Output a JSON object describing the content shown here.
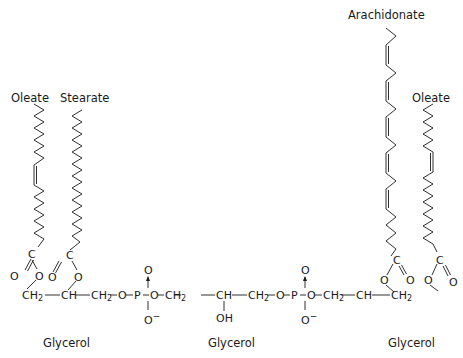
{
  "diagram": {
    "type": "chemical-structure",
    "fatty_acid_labels": [
      {
        "id": "left-1",
        "text": "Oleate"
      },
      {
        "id": "left-2",
        "text": "Stearate"
      },
      {
        "id": "right-1",
        "text": "Arachidonate"
      },
      {
        "id": "right-2",
        "text": "Oleate"
      }
    ],
    "backbone_labels": [
      {
        "id": "glycerol-left",
        "text": "Glycerol"
      },
      {
        "id": "glycerol-middle",
        "text": "Glycerol"
      },
      {
        "id": "glycerol-right",
        "text": "Glycerol"
      }
    ],
    "atoms": {
      "carbonyl_c": "C",
      "carbonyl_o": "O",
      "ester_o": "O",
      "ch2": "CH",
      "ch2_sub": "2",
      "ch": "CH",
      "bridge_o": "O",
      "phosphorus": "P",
      "phosphate_o_top": "O",
      "phosphate_o_bottom": "O",
      "minus": "−",
      "oh": "OH"
    },
    "colors": {
      "ink": "#1a1a1a",
      "background": "#ffffff"
    }
  }
}
